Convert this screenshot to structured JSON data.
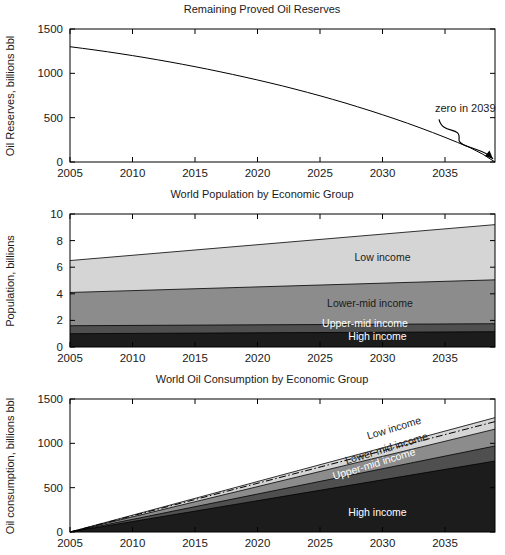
{
  "figure": {
    "width": 505,
    "height": 555,
    "background": "#ffffff"
  },
  "palette": {
    "high_income": "#1c1c1c",
    "upper_mid_income": "#4f4f4f",
    "lower_mid_income": "#8c8c8c",
    "low_income": "#d5d5d5",
    "axis": "#000000",
    "text": "#1a1a1a"
  },
  "chart_data": [
    {
      "id": "reserves",
      "type": "line",
      "title": "Remaining Proved Oil Reserves",
      "xlabel": "",
      "ylabel": "Oil Reserves, billions bbl",
      "xlim": [
        2005,
        2039
      ],
      "ylim": [
        0,
        1500
      ],
      "xticks": [
        2005,
        2010,
        2015,
        2020,
        2025,
        2030,
        2035
      ],
      "yticks": [
        0,
        500,
        1000,
        1500
      ],
      "grid": false,
      "legend": "none",
      "x": [
        2005,
        2006,
        2007,
        2008,
        2009,
        2010,
        2011,
        2012,
        2013,
        2014,
        2015,
        2016,
        2017,
        2018,
        2019,
        2020,
        2021,
        2022,
        2023,
        2024,
        2025,
        2026,
        2027,
        2028,
        2029,
        2030,
        2031,
        2032,
        2033,
        2034,
        2035,
        2036,
        2037,
        2038,
        2039
      ],
      "series": [
        {
          "name": "Remaining proved oil reserves",
          "values": [
            1300,
            1282,
            1263,
            1243,
            1222,
            1200,
            1177,
            1153,
            1128,
            1102,
            1075,
            1047,
            1018,
            988,
            957,
            925,
            892,
            858,
            822,
            785,
            747,
            707,
            666,
            623,
            579,
            533,
            486,
            437,
            386,
            333,
            278,
            221,
            162,
            90,
            0
          ]
        }
      ],
      "annotations": [
        {
          "text": "zero in 2039",
          "x": 2034.2,
          "y": 560,
          "points_to_x": 2039,
          "points_to_y": 0
        }
      ]
    },
    {
      "id": "population",
      "type": "area",
      "stacked": true,
      "title": "World Population by Economic Group",
      "xlabel": "",
      "ylabel": "Population, billions",
      "xlim": [
        2005,
        2039
      ],
      "ylim": [
        0,
        10
      ],
      "xticks": [
        2005,
        2010,
        2015,
        2020,
        2025,
        2030,
        2035
      ],
      "yticks": [
        0,
        2,
        4,
        6,
        8,
        10
      ],
      "grid": false,
      "legend": "inline-right",
      "x": [
        2005,
        2039
      ],
      "series": [
        {
          "name": "High income",
          "color": "#1c1c1c",
          "values": [
            1.0,
            1.15
          ]
        },
        {
          "name": "Upper-mid income",
          "color": "#4f4f4f",
          "values": [
            0.6,
            0.6
          ]
        },
        {
          "name": "Lower-mid income",
          "color": "#8c8c8c",
          "values": [
            2.5,
            3.3
          ]
        },
        {
          "name": "Low income",
          "color": "#d5d5d5",
          "values": [
            2.4,
            4.15
          ]
        }
      ],
      "cumulative_tops": {
        "high_income": [
          1.0,
          1.15
        ],
        "upper_mid_income": [
          1.6,
          1.75
        ],
        "lower_mid_income": [
          4.1,
          5.05
        ],
        "low_income": [
          6.5,
          9.2
        ]
      },
      "series_labels": [
        {
          "text": "Low income",
          "x": 2030.0,
          "y": 6.5,
          "color": "#1a1a1a"
        },
        {
          "text": "Lower-mid income",
          "x": 2029.0,
          "y": 3.0,
          "color": "#1a1a1a"
        },
        {
          "text": "Upper-mid income",
          "x": 2028.6,
          "y": 1.52,
          "color": "#ffffff"
        },
        {
          "text": "High income",
          "x": 2029.6,
          "y": 0.5,
          "color": "#ffffff"
        }
      ]
    },
    {
      "id": "consumption",
      "type": "area",
      "stacked": true,
      "title": "World Oil Consumption by Economic Group",
      "xlabel": "",
      "ylabel": "Oil consumption, billions bbl",
      "xlim": [
        2005,
        2039
      ],
      "ylim": [
        0,
        1500
      ],
      "xticks": [
        2005,
        2010,
        2015,
        2020,
        2025,
        2030,
        2035
      ],
      "yticks": [
        0,
        500,
        1000,
        1500
      ],
      "grid": false,
      "legend": "inline-right",
      "x": [
        2005,
        2039
      ],
      "series": [
        {
          "name": "High income",
          "color": "#1c1c1c",
          "values": [
            0,
            800
          ]
        },
        {
          "name": "Upper-mid income",
          "color": "#4f4f4f",
          "values": [
            0,
            170
          ]
        },
        {
          "name": "Lower-mid income",
          "color": "#8c8c8c",
          "values": [
            0,
            190
          ]
        },
        {
          "name": "Low income",
          "color": "#d5d5d5",
          "values": [
            0,
            130
          ]
        }
      ],
      "cumulative_tops": {
        "high_income": [
          0,
          800
        ],
        "upper_mid_income": [
          0,
          970
        ],
        "lower_mid_income": [
          0,
          1160
        ],
        "low_income": [
          0,
          1290
        ]
      },
      "overlay_line": {
        "name": "cumulative-consumption-dashdot",
        "style": "dash-dot",
        "values": [
          0,
          1245
        ]
      },
      "series_labels": [
        {
          "text": "Low income",
          "x": 2031.0,
          "y": 1135,
          "color": "#1a1a1a",
          "rotate": -17
        },
        {
          "text": "Lower-mid income",
          "x": 2030.4,
          "y": 905,
          "color": "#1a1a1a",
          "rotate": -17
        },
        {
          "text": "Upper-mid income",
          "x": 2029.4,
          "y": 730,
          "color": "#ffffff",
          "rotate": -17
        },
        {
          "text": "High income",
          "x": 2029.6,
          "y": 185,
          "color": "#ffffff",
          "rotate": 0
        }
      ]
    }
  ]
}
